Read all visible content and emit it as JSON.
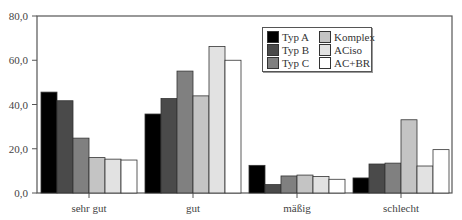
{
  "chart_data": {
    "type": "bar",
    "title": "",
    "xlabel": "",
    "ylabel": "",
    "ylim": [
      0,
      80
    ],
    "yticks": [
      "0,0",
      "20,0",
      "40,0",
      "60,0",
      "80,0"
    ],
    "categories": [
      "sehr gut",
      "gut",
      "mäßig",
      "schlecht"
    ],
    "grid": false,
    "legend_position": "upper center-right (inside plot)",
    "series": [
      {
        "name": "Typ A",
        "color": "#000000",
        "values": [
          45.6,
          35.7,
          12.5,
          6.8
        ]
      },
      {
        "name": "Typ B",
        "color": "#4a4a4a",
        "values": [
          41.7,
          42.7,
          3.8,
          13.1
        ]
      },
      {
        "name": "Typ C",
        "color": "#808080",
        "values": [
          24.8,
          55.1,
          7.7,
          13.5
        ]
      },
      {
        "name": "Komplex",
        "color": "#c4c4c4",
        "values": [
          16.0,
          43.9,
          8.1,
          33.1
        ]
      },
      {
        "name": "ACiso",
        "color": "#e2e2e2",
        "values": [
          15.3,
          66.2,
          7.5,
          12.2
        ]
      },
      {
        "name": "AC+BR",
        "color": "#ffffff",
        "values": [
          14.9,
          60.0,
          6.2,
          19.6
        ]
      }
    ]
  }
}
